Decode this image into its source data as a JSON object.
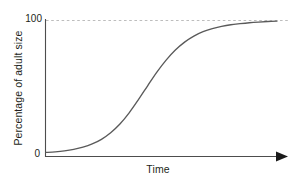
{
  "chart_data": {
    "type": "line",
    "title": "",
    "subtitle": "",
    "xlabel": "Time",
    "ylabel": "Percentage of adult size",
    "xticklabels": [],
    "yticklabels": [
      "0",
      "100"
    ],
    "ytick_0": "0",
    "ytick_100": "100",
    "ylim": [
      0,
      108
    ],
    "xlim": [
      0,
      100
    ],
    "grid": false,
    "legend": null,
    "annotations": [
      {
        "name": "asymptote-line",
        "type": "horizontal-dashed-reference-line",
        "value": 100,
        "label": "100",
        "color": "#bdbdbd"
      }
    ],
    "axis_arrow_x": true,
    "line_color": "#5a5a5a",
    "series": [
      {
        "name": "growth-curve",
        "shape": "sigmoid",
        "x": [
          0,
          4,
          8,
          12,
          16,
          20,
          24,
          28,
          32,
          36,
          40,
          44,
          48,
          52,
          56,
          60,
          64,
          68,
          72,
          76,
          80,
          84,
          88,
          92,
          96,
          100
        ],
        "values": [
          3,
          3.4,
          4.1,
          5.2,
          6.8,
          9.2,
          12.6,
          17.4,
          23.8,
          32.0,
          41.6,
          51.8,
          61.8,
          70.6,
          78.0,
          83.8,
          88.2,
          91.4,
          93.7,
          95.3,
          96.5,
          97.3,
          98.0,
          98.5,
          98.9,
          99.2
        ]
      }
    ]
  }
}
